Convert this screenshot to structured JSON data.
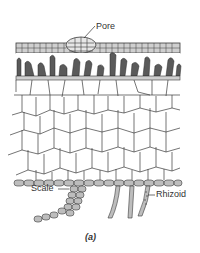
{
  "figure": {
    "caption": "(a)",
    "labels": {
      "pore": "Pore",
      "scale": "Scale",
      "rhizoid": "Rhizoid"
    },
    "colors": {
      "stroke": "#3a3a3a",
      "cell_fill_gray": "#c8c8c8",
      "dark_cell": "#555555",
      "background": "#ffffff"
    }
  }
}
